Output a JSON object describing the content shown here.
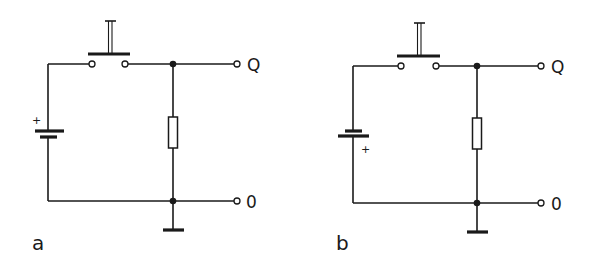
{
  "colors": {
    "line": "#1a1a1a",
    "background": "#ffffff"
  },
  "diagrams": [
    {
      "id": "a",
      "label": "a",
      "battery_polarity_label": "+",
      "battery_orientation": "long-plate-top",
      "output_top_label": "Q",
      "output_bottom_label": "0",
      "components": [
        "battery",
        "push-button-switch",
        "resistor",
        "ground",
        "output-terminal-Q",
        "output-terminal-0"
      ]
    },
    {
      "id": "b",
      "label": "b",
      "battery_polarity_label": "+",
      "battery_orientation": "long-plate-bottom",
      "output_top_label": "Q",
      "output_bottom_label": "0",
      "components": [
        "battery",
        "push-button-switch",
        "resistor",
        "ground",
        "output-terminal-Q",
        "output-terminal-0"
      ]
    }
  ]
}
